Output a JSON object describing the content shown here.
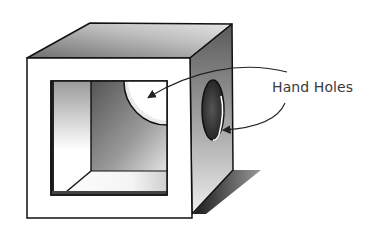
{
  "diagram": {
    "callout_label": "Hand Holes",
    "callout_targets": [
      "back-wall-hand-hole",
      "side-wall-hand-hole"
    ]
  }
}
